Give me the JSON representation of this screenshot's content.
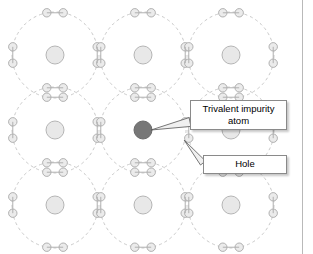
{
  "diagram": {
    "type": "semiconductor-doping-lattice",
    "colors": {
      "orbit_stroke": "#c9c9c9",
      "electron_fill": "#ebebeb",
      "electron_stroke": "#b0b0b0",
      "nucleus_fill": "#e8e8e8",
      "nucleus_stroke": "#b5b5b5",
      "impurity_nucleus_fill": "#777777",
      "impurity_nucleus_stroke": "#6a6a6a",
      "leader_fill": "#f0f0f0",
      "leader_stroke": "#555555",
      "box_border": "#8a8a8a",
      "box_background": "#ffffff",
      "frame_rule": "#b9b9b9"
    },
    "lattice": {
      "rows": 3,
      "columns": 3,
      "origin_x": 55,
      "origin_y": 55,
      "spacing_x": 88,
      "spacing_y": 75,
      "orbit_radius": 43,
      "nucleus_radius": 9,
      "electron_radius": 4.2,
      "electrons_per_atom": 8,
      "impurity_cell": {
        "row": 1,
        "column": 1
      },
      "hole_angle_degrees": 20
    }
  },
  "callouts": {
    "trivalent": {
      "label": "Trivalent impurity\natom",
      "line1": "Trivalent impurity",
      "line2": "atom"
    },
    "hole": {
      "label": "Hole"
    }
  }
}
